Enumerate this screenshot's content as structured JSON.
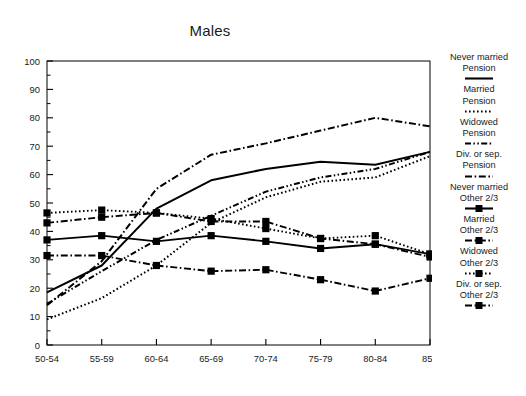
{
  "chart_data": {
    "type": "line",
    "title": "Males",
    "xlabel": "",
    "ylabel": "",
    "categories": [
      "50-54",
      "55-59",
      "60-64",
      "65-69",
      "70-74",
      "75-79",
      "80-84",
      "85+"
    ],
    "ylim": [
      0,
      100
    ],
    "yticks": [
      0,
      10,
      20,
      30,
      40,
      50,
      60,
      70,
      80,
      90,
      100
    ],
    "ytick_labels": [
      "0",
      "10",
      "20",
      "30",
      "40",
      "50",
      "60",
      "70",
      "80",
      "90",
      "100"
    ],
    "minor_ytick_step": 5,
    "grid": false,
    "legend_position": "right",
    "series": [
      {
        "name": "Never married Pension",
        "label_line1": "Never married",
        "label_line2": "Pension",
        "style": "solid",
        "marker": "none",
        "color": "#000000",
        "values": [
          18.5,
          28.0,
          48.0,
          58.0,
          62.0,
          64.5,
          63.5,
          68.0
        ]
      },
      {
        "name": "Married Pension",
        "label_line1": "Married",
        "label_line2": "Pension",
        "style": "dotted",
        "marker": "none",
        "color": "#000000",
        "values": [
          9.0,
          16.5,
          28.0,
          43.0,
          52.0,
          57.5,
          59.0,
          66.5
        ]
      },
      {
        "name": "Widowed Pension",
        "label_line1": "Widowed",
        "label_line2": "Pension",
        "style": "dash-dot-dot",
        "marker": "none",
        "color": "#000000",
        "values": [
          14.5,
          26.0,
          37.0,
          45.5,
          54.0,
          59.0,
          62.0,
          68.0
        ]
      },
      {
        "name": "Div. or sep. Pension",
        "label_line1": "Div. or sep.",
        "label_line2": "Pension",
        "style": "dash-dot",
        "marker": "none",
        "color": "#000000",
        "values": [
          14.0,
          29.5,
          55.0,
          67.0,
          71.0,
          75.5,
          80.0,
          77.0
        ]
      },
      {
        "name": "Never married Other 2/3",
        "label_line1": "Never married",
        "label_line2": "Other 2/3",
        "style": "solid",
        "marker": "square",
        "color": "#000000",
        "values": [
          37.0,
          38.5,
          36.5,
          38.5,
          36.5,
          34.0,
          35.5,
          32.0
        ]
      },
      {
        "name": "Married Other 2/3",
        "label_line1": "Married",
        "label_line2": "Other 2/3",
        "style": "dash-dot",
        "marker": "square",
        "color": "#000000",
        "values": [
          31.5,
          31.5,
          28.0,
          26.0,
          26.5,
          23.0,
          19.0,
          23.5
        ]
      },
      {
        "name": "Widowed Other 2/3",
        "label_line1": "Widowed",
        "label_line2": "Other 2/3",
        "style": "dotted",
        "marker": "square",
        "color": "#000000",
        "values": [
          46.5,
          47.5,
          46.5,
          44.5,
          41.0,
          37.5,
          38.5,
          32.0
        ]
      },
      {
        "name": "Div. or sep. Other 2/3",
        "label_line1": "Div. or sep.",
        "label_line2": "Other 2/3",
        "style": "dash-dot",
        "marker": "square",
        "color": "#000000",
        "values": [
          43.0,
          45.0,
          46.5,
          43.5,
          43.5,
          37.5,
          35.5,
          31.0
        ]
      }
    ]
  }
}
